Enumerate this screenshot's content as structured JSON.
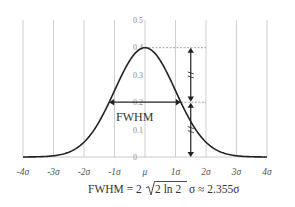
{
  "chart_data": {
    "type": "line",
    "title": "",
    "xlabel": "",
    "ylabel": "",
    "x_ticks": [
      "-4σ",
      "-3σ",
      "-2σ",
      "-1σ",
      "μ",
      "1σ",
      "2σ",
      "3σ",
      "4σ"
    ],
    "x_tick_values": [
      -4,
      -3,
      -2,
      -1,
      0,
      1,
      2,
      3,
      4
    ],
    "y_ticks": [
      "0",
      "0.1",
      "0.2",
      "0.3",
      "0.4",
      "0.5"
    ],
    "y_tick_values": [
      0,
      0.1,
      0.2,
      0.3,
      0.4,
      0.5
    ],
    "xlim": [
      -4,
      4
    ],
    "ylim": [
      0,
      0.5
    ],
    "grid": "vertical",
    "series": [
      {
        "name": "Normal distribution N(μ, σ)",
        "function": "standard normal pdf",
        "x": [
          -4,
          -3,
          -2,
          -1,
          0,
          1,
          2,
          3,
          4
        ],
        "values": [
          0.0001,
          0.0044,
          0.054,
          0.242,
          0.399,
          0.242,
          0.054,
          0.0044,
          0.0001
        ]
      }
    ],
    "annotations": {
      "peak_value": 0.399,
      "half_max_value": 0.2,
      "fwhm_label": "FWHM",
      "fwhm_half_width_sigma": 1.1774,
      "arrow_x_sigma": 1.5,
      "formula": "FWHM = 2√2 ln 2 σ ≈ 2.355σ"
    }
  },
  "formula_parts": {
    "lhs": "FWHM = 2",
    "radicand": "2 ln 2",
    "rhs": "σ ≈ 2.355σ"
  }
}
